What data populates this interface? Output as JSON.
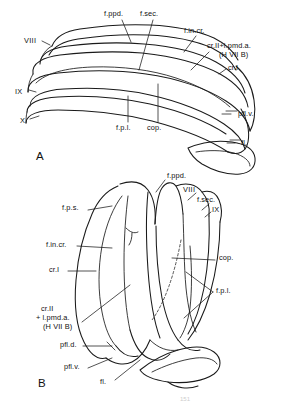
{
  "figure": {
    "caption_mark": "151",
    "panels": [
      {
        "id": "A",
        "letter": "A",
        "view": "lateral view of cerebellum",
        "labels": [
          {
            "key": "a-f-ppd",
            "text": "f.ppd.",
            "x": 104,
            "y": 10
          },
          {
            "key": "a-f-sec",
            "text": "f.sec.",
            "x": 140,
            "y": 10
          },
          {
            "key": "a-f-in-cr",
            "text": "f.in.cr.",
            "x": 184,
            "y": 27
          },
          {
            "key": "a-cr2",
            "text": "cr.II+l.pmd.a.",
            "x": 211,
            "y": 42
          },
          {
            "key": "a-hviib",
            "text": "(H VII B)",
            "x": 222,
            "y": 51
          },
          {
            "key": "a-cr1",
            "text": "cr.I",
            "x": 227,
            "y": 66
          },
          {
            "key": "a-viii",
            "text": "VIII",
            "x": 26,
            "y": 39
          },
          {
            "key": "a-ix",
            "text": "IX",
            "x": 16,
            "y": 92
          },
          {
            "key": "a-x",
            "text": "X",
            "x": 21,
            "y": 121
          },
          {
            "key": "a-f-p-l",
            "text": "f.p.l.",
            "x": 118,
            "y": 125
          },
          {
            "key": "a-cop",
            "text": "cop.",
            "x": 149,
            "y": 125
          },
          {
            "key": "a-pfl-v",
            "text": "pfl.v.",
            "x": 232,
            "y": 116
          },
          {
            "key": "a-fl",
            "text": "fl.",
            "x": 236,
            "y": 145
          }
        ]
      },
      {
        "id": "B",
        "letter": "B",
        "view": "dorsal view of cerebellum",
        "labels": [
          {
            "key": "b-f-ppd",
            "text": "f.ppd.",
            "x": 167,
            "y": 172
          },
          {
            "key": "b-viii",
            "text": "VIII",
            "x": 184,
            "y": 187
          },
          {
            "key": "b-f-sec",
            "text": "f.sec.",
            "x": 199,
            "y": 198
          },
          {
            "key": "b-ix",
            "text": "IX",
            "x": 212,
            "y": 207
          },
          {
            "key": "b-f-p-s",
            "text": "f.p.s.",
            "x": 66,
            "y": 207
          },
          {
            "key": "b-f-in-cr",
            "text": "f.in.cr.",
            "x": 48,
            "y": 243
          },
          {
            "key": "b-cr1",
            "text": "cr.I",
            "x": 50,
            "y": 268
          },
          {
            "key": "b-cop",
            "text": "cop.",
            "x": 217,
            "y": 258
          },
          {
            "key": "b-f-p-l",
            "text": "f.p.l.",
            "x": 215,
            "y": 290
          },
          {
            "key": "b-cr2",
            "text": "cr.II",
            "x": 41,
            "y": 307
          },
          {
            "key": "b-lpmda",
            "text": "+ l.pmd.a.",
            "x": 36,
            "y": 316
          },
          {
            "key": "b-hviib",
            "text": "(H VII B)",
            "x": 44,
            "y": 325
          },
          {
            "key": "b-pfl-d",
            "text": "pfl.d.",
            "x": 61,
            "y": 344
          },
          {
            "key": "b-pfl-v",
            "text": "pfl.v.",
            "x": 65,
            "y": 366
          },
          {
            "key": "b-fl",
            "text": "fl.",
            "x": 101,
            "y": 381
          }
        ]
      }
    ]
  }
}
